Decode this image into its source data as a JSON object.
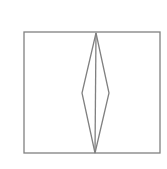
{
  "figure": {
    "width": 167,
    "height": 169,
    "background": "#ffffff",
    "stroke_color": "#808080",
    "stroke_width": 1.3,
    "shapes": {
      "outer_rectangle": {
        "x": 24,
        "y": 32,
        "width": 136,
        "height": 121
      },
      "center_line": {
        "x1": 96,
        "y1": 33,
        "x2": 95,
        "y2": 153
      },
      "diamond": {
        "top": [
          96,
          33
        ],
        "right": [
          109,
          93
        ],
        "bottom": [
          95,
          153
        ],
        "left": [
          82,
          93
        ]
      }
    }
  }
}
